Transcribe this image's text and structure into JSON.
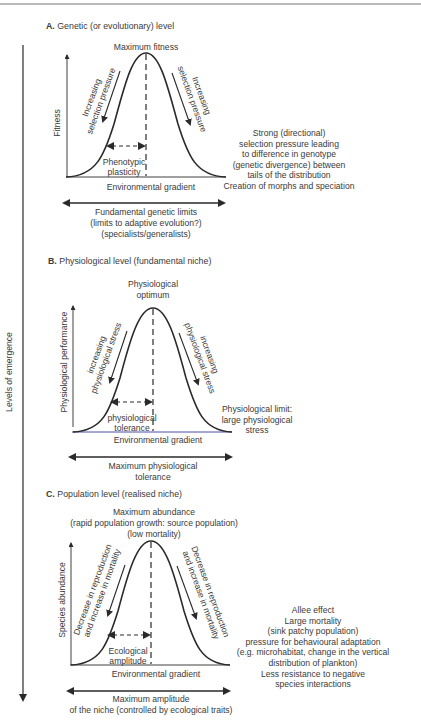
{
  "figure": {
    "vertical_axis_label": "Levels of emergence",
    "colors": {
      "ink": "#2a2a2a",
      "text": "#3a3a3a",
      "rule": "#777777",
      "axis_accent": "#3b3ba0"
    }
  },
  "panels": [
    {
      "id": "A",
      "letter": "A.",
      "title": "Genetic (or evolutionary) level",
      "peak_label": [
        "Maximum fitness"
      ],
      "y_axis_label": "Fitness",
      "x_axis_label": "Environmental gradient",
      "left_arrow_label": [
        "Increasing",
        "selection pressure"
      ],
      "right_arrow_label": [
        "Increasing",
        "selection pressure"
      ],
      "width_label": [
        "Phenotypic",
        "plasticity"
      ],
      "range_label": [
        "Fundamental genetic limits",
        "(limits to adaptive evolution?)",
        "(specialists/generalists)"
      ],
      "side_note": [
        "Strong (directional)",
        "selection pressure leading",
        "to  difference in genotype",
        "(genetic divergence)  between",
        "tails of the distribution",
        "Creation of morphs and speciation"
      ]
    },
    {
      "id": "B",
      "letter": "B.",
      "title": "Physiological level (fundamental niche)",
      "peak_label": [
        "Physiological",
        "optimum"
      ],
      "y_axis_label": "Physiological performance",
      "x_axis_label": "Environmental gradient",
      "left_arrow_label": [
        "increasing",
        "physiological stress"
      ],
      "right_arrow_label": [
        "increasing",
        "physiological stress"
      ],
      "width_label": [
        "physiological",
        "tolerance"
      ],
      "range_label": [
        "Maximum physiological",
        "tolerance"
      ],
      "side_note": [
        "Physiological limit:",
        "large physiological",
        "stress"
      ]
    },
    {
      "id": "C",
      "letter": "C.",
      "title": "Population level (realised niche)",
      "peak_label": [
        "Maximum abundance",
        "(rapid population growth: source population)",
        "(low mortality)"
      ],
      "y_axis_label": "Species abundance",
      "x_axis_label": "Environmental gradient",
      "left_arrow_label": [
        "Decrease in reproduction",
        "and increase in mortality"
      ],
      "right_arrow_label": [
        "Decrease in reproduction",
        "and increase in mortality"
      ],
      "width_label": [
        "Ecological",
        "amplitude"
      ],
      "range_label": [
        "Maximum amplitude",
        "of the niche (controlled by ecological traits)"
      ],
      "side_note": [
        "Allee effect",
        "Large mortality",
        "(sink patchy population)",
        "pressure for behavioural adaptation",
        "(e.g. microhabitat, change in the vertical",
        "distribution of plankton)",
        "Less resistance to negative",
        "species interactions"
      ]
    }
  ]
}
